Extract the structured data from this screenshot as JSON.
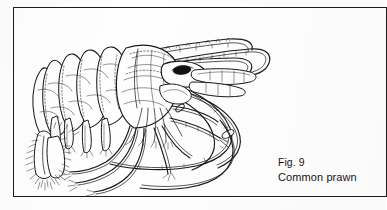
{
  "figure": {
    "number_label": "Fig. 9",
    "title": "Common prawn",
    "subject": "common prawn",
    "illustration_style": "black-and-white line drawing",
    "orientation": "head facing right, tail at left",
    "frame": {
      "border_color": "#1c1c1c",
      "background_color": "#fefefe",
      "ink_color": "#1a1a1a"
    },
    "page_background_color": "#fdfdfd",
    "anatomy_labels": [
      "rostrum",
      "antennal scale",
      "eye",
      "carapace",
      "abdominal segments",
      "pleopods",
      "pereiopods",
      "chelipeds",
      "antennae",
      "telson",
      "uropods"
    ]
  }
}
